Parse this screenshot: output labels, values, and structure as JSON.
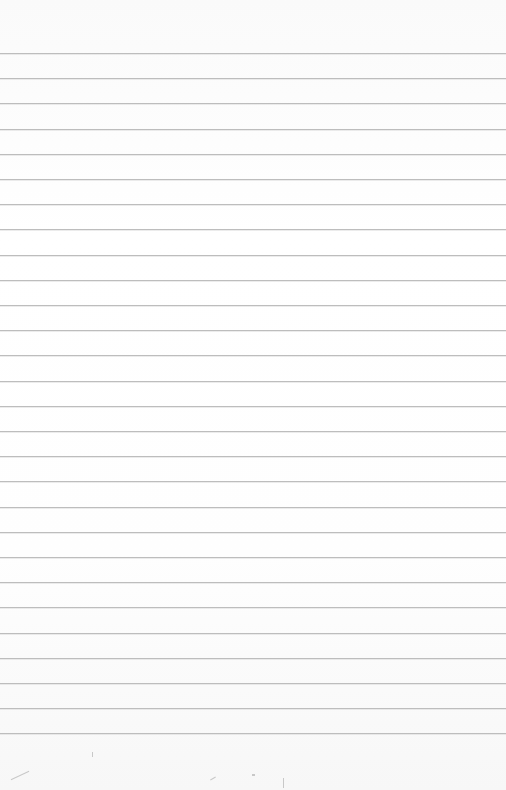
{
  "paper": {
    "background": "#fdfdfd",
    "rule_color": "#bdbdbd",
    "first_rule_y": 53,
    "rule_spacing": 25.2,
    "rule_count": 28
  }
}
